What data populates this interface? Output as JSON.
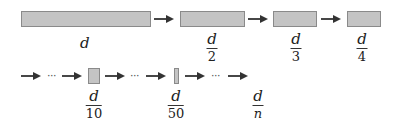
{
  "diagram": {
    "colors": {
      "box_fill": "#c4c4c4",
      "box_border": "#8a8a8a",
      "arrow": "#333333",
      "text": "#222222"
    },
    "row1": {
      "boxes": [
        {
          "id": "d",
          "label": "d",
          "numerator": "d",
          "denominator": ""
        },
        {
          "id": "d2",
          "numerator": "d",
          "denominator": "2"
        },
        {
          "id": "d3",
          "numerator": "d",
          "denominator": "3"
        },
        {
          "id": "d4",
          "numerator": "d",
          "denominator": "4"
        }
      ]
    },
    "row2": {
      "ellipsis": "···",
      "boxes": [
        {
          "id": "d10",
          "numerator": "d",
          "denominator": "10"
        },
        {
          "id": "d50",
          "numerator": "d",
          "denominator": "50"
        },
        {
          "id": "dn",
          "numerator": "d",
          "denominator": "n"
        }
      ]
    }
  }
}
